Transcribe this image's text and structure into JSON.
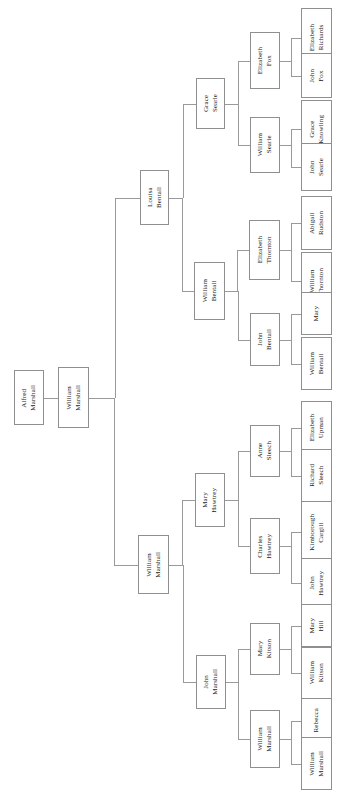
{
  "diagram": {
    "type": "genealogy-tree",
    "orientation": "left-to-right",
    "text_orientation": "vertical",
    "box_border_color": "#8f8f8f",
    "edge_color": "#9a9a9a",
    "background_color": "#ffffff",
    "text_color": "#1a1a1a"
  },
  "nodes": [
    {
      "id": "n0",
      "label": "Alfred\nMarshall",
      "generation": 0,
      "x": 14,
      "y": 370,
      "w": 30,
      "h": 55
    },
    {
      "id": "n1",
      "label": "William\nMarshall",
      "generation": 1,
      "x": 58,
      "y": 367,
      "w": 31,
      "h": 61
    },
    {
      "id": "n2",
      "label": "Louisa\nBentall",
      "generation": 2,
      "x": 140,
      "y": 170,
      "w": 29,
      "h": 55
    },
    {
      "id": "n3",
      "label": "William\nMarshall",
      "generation": 2,
      "x": 138,
      "y": 535,
      "w": 31,
      "h": 59
    },
    {
      "id": "n4",
      "label": "Grace\nSearle",
      "generation": 3,
      "x": 196,
      "y": 78,
      "w": 29,
      "h": 51
    },
    {
      "id": "n5",
      "label": "William\nBentall",
      "generation": 3,
      "x": 194,
      "y": 262,
      "w": 31,
      "h": 58
    },
    {
      "id": "n6",
      "label": "Mary\nHawtrey",
      "generation": 3,
      "x": 195,
      "y": 473,
      "w": 30,
      "h": 54
    },
    {
      "id": "n7",
      "label": "John\nMarshall",
      "generation": 3,
      "x": 196,
      "y": 655,
      "w": 30,
      "h": 54
    },
    {
      "id": "n8",
      "label": "Elizabeth\nFox",
      "generation": 4,
      "x": 250,
      "y": 32,
      "w": 30,
      "h": 57
    },
    {
      "id": "n9",
      "label": "William\nSearle",
      "generation": 4,
      "x": 250,
      "y": 117,
      "w": 30,
      "h": 56
    },
    {
      "id": "n10",
      "label": "Elizabeth\nThornton",
      "generation": 4,
      "x": 249,
      "y": 220,
      "w": 31,
      "h": 60
    },
    {
      "id": "n11",
      "label": "John\nBentall",
      "generation": 4,
      "x": 250,
      "y": 313,
      "w": 30,
      "h": 53
    },
    {
      "id": "n12",
      "label": "Anne\nSleech",
      "generation": 4,
      "x": 250,
      "y": 425,
      "w": 30,
      "h": 52
    },
    {
      "id": "n13",
      "label": "Charles\nHawtrey",
      "generation": 4,
      "x": 250,
      "y": 518,
      "w": 30,
      "h": 56
    },
    {
      "id": "n14",
      "label": "Mary\nKitson",
      "generation": 4,
      "x": 250,
      "y": 623,
      "w": 30,
      "h": 52
    },
    {
      "id": "n15",
      "label": "William\nMarshall",
      "generation": 4,
      "x": 250,
      "y": 710,
      "w": 30,
      "h": 58
    },
    {
      "id": "n16",
      "label": "Elizabeth\nRichards",
      "generation": 5,
      "x": 301,
      "y": 8,
      "w": 31,
      "h": 60
    },
    {
      "id": "n17",
      "label": "John\nFox",
      "generation": 5,
      "x": 301,
      "y": 53,
      "w": 31,
      "h": 45
    },
    {
      "id": "n18",
      "label": "Grace\nKnowling",
      "generation": 5,
      "x": 301,
      "y": 100,
      "w": 31,
      "h": 58
    },
    {
      "id": "n19",
      "label": "John\nSearle",
      "generation": 5,
      "x": 301,
      "y": 143,
      "w": 31,
      "h": 48
    },
    {
      "id": "n20",
      "label": "Abigail\nRudston",
      "generation": 5,
      "x": 301,
      "y": 196,
      "w": 31,
      "h": 54
    },
    {
      "id": "n21",
      "label": "William\nThornton",
      "generation": 5,
      "x": 301,
      "y": 252,
      "w": 31,
      "h": 58
    },
    {
      "id": "n22",
      "label": "Mary",
      "generation": 5,
      "x": 301,
      "y": 292,
      "w": 31,
      "h": 43
    },
    {
      "id": "n23",
      "label": "William\nBentall",
      "generation": 5,
      "x": 301,
      "y": 337,
      "w": 31,
      "h": 53
    },
    {
      "id": "n24",
      "label": "Elizabeth\nUpman",
      "generation": 5,
      "x": 301,
      "y": 401,
      "w": 31,
      "h": 53
    },
    {
      "id": "n25",
      "label": "Richard\nSleech",
      "generation": 5,
      "x": 301,
      "y": 449,
      "w": 31,
      "h": 53
    },
    {
      "id": "n26",
      "label": "Kimborough\nCargill",
      "generation": 5,
      "x": 301,
      "y": 501,
      "w": 31,
      "h": 62
    },
    {
      "id": "n27",
      "label": "John\nHawtrey",
      "generation": 5,
      "x": 301,
      "y": 558,
      "w": 31,
      "h": 50
    },
    {
      "id": "n28",
      "label": "Mary\nHill",
      "generation": 5,
      "x": 301,
      "y": 604,
      "w": 31,
      "h": 43
    },
    {
      "id": "n29",
      "label": "William\nKitson",
      "generation": 5,
      "x": 301,
      "y": 647,
      "w": 31,
      "h": 52
    },
    {
      "id": "n30",
      "label": "Rebecca",
      "generation": 5,
      "x": 301,
      "y": 698,
      "w": 31,
      "h": 45
    },
    {
      "id": "n31",
      "label": "William\nMarshall",
      "generation": 5,
      "x": 301,
      "y": 737,
      "w": 31,
      "h": 53
    }
  ],
  "edges": [
    {
      "from": "n0",
      "to": "n1"
    },
    {
      "from": "n1",
      "to": "n2"
    },
    {
      "from": "n1",
      "to": "n3"
    },
    {
      "from": "n2",
      "to": "n4"
    },
    {
      "from": "n2",
      "to": "n5"
    },
    {
      "from": "n3",
      "to": "n6"
    },
    {
      "from": "n3",
      "to": "n7"
    },
    {
      "from": "n4",
      "to": "n8"
    },
    {
      "from": "n4",
      "to": "n9"
    },
    {
      "from": "n5",
      "to": "n10"
    },
    {
      "from": "n5",
      "to": "n11"
    },
    {
      "from": "n6",
      "to": "n12"
    },
    {
      "from": "n6",
      "to": "n13"
    },
    {
      "from": "n7",
      "to": "n14"
    },
    {
      "from": "n7",
      "to": "n15"
    },
    {
      "from": "n8",
      "to": "n16"
    },
    {
      "from": "n8",
      "to": "n17"
    },
    {
      "from": "n9",
      "to": "n18"
    },
    {
      "from": "n9",
      "to": "n19"
    },
    {
      "from": "n10",
      "to": "n20"
    },
    {
      "from": "n10",
      "to": "n21"
    },
    {
      "from": "n11",
      "to": "n22"
    },
    {
      "from": "n11",
      "to": "n23"
    },
    {
      "from": "n12",
      "to": "n24"
    },
    {
      "from": "n12",
      "to": "n25"
    },
    {
      "from": "n13",
      "to": "n26"
    },
    {
      "from": "n13",
      "to": "n27"
    },
    {
      "from": "n14",
      "to": "n28"
    },
    {
      "from": "n14",
      "to": "n29"
    },
    {
      "from": "n15",
      "to": "n30"
    },
    {
      "from": "n15",
      "to": "n31"
    }
  ]
}
